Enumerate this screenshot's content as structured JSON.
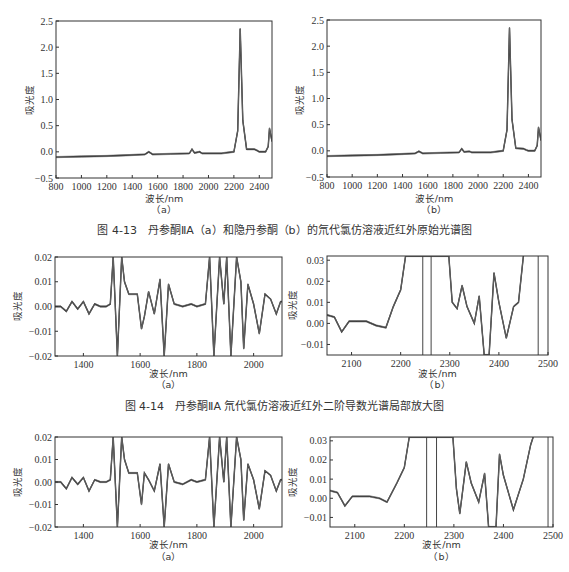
{
  "figures": [
    {
      "id": "fig-4-13",
      "caption": "图 4-13　丹参酮ⅡA（a）和隐丹参酮（b）的氘代氯仿溶液近红外原始光谱图"
    },
    {
      "id": "fig-4-14",
      "caption": "图 4-14　丹参酮ⅡA 氘代氯仿溶液近红外二阶导数光谱局部放大图"
    },
    {
      "id": "fig-4-15",
      "caption": ""
    }
  ],
  "common": {
    "xlabel": "波长/nm",
    "ylabel": "吸光度",
    "sub_a": "（a）",
    "sub_b": "（b）"
  },
  "chart_data": [
    {
      "panel": "4-13a",
      "type": "line",
      "title": "",
      "xlabel": "波长/nm",
      "ylabel": "吸光度",
      "xlim": [
        800,
        2500
      ],
      "ylim": [
        -0.5,
        2.5
      ],
      "xticks": [
        800,
        1000,
        1200,
        1400,
        1600,
        1800,
        2000,
        2200,
        2400
      ],
      "yticks": [
        -0.5,
        0.0,
        0.5,
        1.0,
        1.5,
        2.0,
        2.5
      ],
      "x": [
        800,
        1000,
        1200,
        1400,
        1500,
        1530,
        1560,
        1700,
        1850,
        1870,
        1890,
        1930,
        1950,
        2100,
        2200,
        2230,
        2250,
        2270,
        2300,
        2360,
        2380,
        2400,
        2450,
        2470,
        2480,
        2500
      ],
      "y": [
        -0.1,
        -0.09,
        -0.08,
        -0.06,
        -0.05,
        0.0,
        -0.05,
        -0.04,
        -0.03,
        0.05,
        -0.02,
        -0.0,
        -0.03,
        -0.03,
        0.0,
        0.4,
        2.35,
        0.6,
        0.05,
        0.05,
        0.03,
        0.0,
        0.0,
        0.1,
        0.45,
        0.2
      ]
    },
    {
      "panel": "4-13b",
      "type": "line",
      "title": "",
      "xlabel": "波长/nm",
      "ylabel": "吸光度",
      "xlim": [
        800,
        2500
      ],
      "ylim": [
        -0.5,
        2.5
      ],
      "xticks": [
        800,
        1000,
        1200,
        1400,
        1600,
        1800,
        2000,
        2200,
        2400
      ],
      "yticks": [
        -0.5,
        0.0,
        0.5,
        1.0,
        1.5,
        2.0,
        2.5
      ],
      "x": [
        800,
        1000,
        1200,
        1400,
        1500,
        1530,
        1560,
        1700,
        1850,
        1870,
        1890,
        1930,
        1950,
        2100,
        2200,
        2230,
        2250,
        2270,
        2300,
        2360,
        2380,
        2400,
        2450,
        2470,
        2480,
        2500
      ],
      "y": [
        -0.1,
        -0.09,
        -0.08,
        -0.06,
        -0.05,
        -0.01,
        -0.05,
        -0.04,
        -0.03,
        0.04,
        -0.02,
        -0.01,
        -0.03,
        -0.03,
        0.0,
        0.4,
        2.35,
        0.6,
        0.05,
        0.04,
        0.02,
        0.0,
        0.0,
        0.1,
        0.45,
        0.2
      ]
    },
    {
      "panel": "4-14a",
      "type": "line",
      "title": "",
      "xlabel": "波长/nm",
      "ylabel": "吸光度",
      "xlim": [
        1300,
        2100
      ],
      "ylim": [
        -0.02,
        0.02
      ],
      "xticks": [
        1400,
        1600,
        1800,
        2000
      ],
      "yticks": [
        -0.02,
        -0.01,
        0.0,
        0.01,
        0.02
      ],
      "x": [
        1300,
        1320,
        1340,
        1360,
        1380,
        1400,
        1420,
        1440,
        1460,
        1480,
        1495,
        1505,
        1520,
        1535,
        1545,
        1560,
        1590,
        1605,
        1615,
        1630,
        1650,
        1670,
        1685,
        1700,
        1720,
        1750,
        1780,
        1800,
        1830,
        1845,
        1860,
        1880,
        1895,
        1905,
        1920,
        1940,
        1955,
        1965,
        1980,
        2000,
        2020,
        2040,
        2060,
        2080,
        2095,
        2100
      ],
      "y": [
        0.0,
        0.0,
        -0.002,
        0.002,
        -0.001,
        0.002,
        -0.003,
        0.001,
        0.0,
        0.0,
        0.001,
        0.02,
        -0.02,
        0.02,
        0.01,
        0.005,
        0.005,
        -0.009,
        -0.004,
        0.006,
        -0.003,
        0.011,
        -0.02,
        0.009,
        0.001,
        0.0,
        0.001,
        0.0,
        0.001,
        0.02,
        -0.02,
        0.02,
        0.001,
        0.02,
        -0.02,
        0.02,
        0.01,
        -0.017,
        0.009,
        0.001,
        -0.011,
        0.005,
        0.003,
        -0.003,
        0.002,
        0.002
      ]
    },
    {
      "panel": "4-14b",
      "type": "line",
      "title": "",
      "xlabel": "波长/nm",
      "ylabel": "吸光度",
      "xlim": [
        2050,
        2500
      ],
      "ylim": [
        -0.015,
        0.032
      ],
      "xticks": [
        2100,
        2200,
        2300,
        2400,
        2500
      ],
      "yticks": [
        -0.01,
        0.0,
        0.01,
        0.02,
        0.03
      ],
      "x": [
        2050,
        2065,
        2080,
        2095,
        2110,
        2130,
        2150,
        2170,
        2185,
        2200,
        2210,
        2245,
        2262,
        2298,
        2305,
        2315,
        2325,
        2335,
        2350,
        2360,
        2370,
        2380,
        2390,
        2400,
        2415,
        2430,
        2440,
        2450
      ],
      "y": [
        0.004,
        0.003,
        -0.004,
        0.001,
        0.001,
        0.001,
        -0.001,
        -0.002,
        0.008,
        0.016,
        0.032,
        0.032,
        0.032,
        0.032,
        0.01,
        0.007,
        0.018,
        0.008,
        0.0,
        0.013,
        -0.015,
        -0.015,
        0.024,
        0.01,
        -0.007,
        0.008,
        0.01,
        0.032
      ],
      "vlines": [
        2245,
        2262,
        2480
      ]
    },
    {
      "panel": "4-15a",
      "type": "line",
      "title": "",
      "xlabel": "波长/nm",
      "ylabel": "吸光度",
      "xlim": [
        1300,
        2100
      ],
      "ylim": [
        -0.02,
        0.02
      ],
      "xticks": [
        1400,
        1600,
        1800,
        2000
      ],
      "yticks": [
        -0.02,
        -0.01,
        0.0,
        0.01,
        0.02
      ],
      "x": [
        1300,
        1320,
        1340,
        1360,
        1380,
        1400,
        1420,
        1440,
        1460,
        1480,
        1495,
        1505,
        1520,
        1535,
        1545,
        1560,
        1590,
        1605,
        1615,
        1630,
        1650,
        1670,
        1685,
        1700,
        1720,
        1750,
        1780,
        1800,
        1830,
        1845,
        1860,
        1880,
        1895,
        1905,
        1920,
        1940,
        1955,
        1965,
        1980,
        2000,
        2020,
        2040,
        2060,
        2080,
        2095,
        2100
      ],
      "y": [
        0.0,
        0.0,
        -0.003,
        0.002,
        -0.001,
        0.002,
        -0.004,
        0.001,
        0.0,
        0.0,
        0.001,
        0.02,
        -0.02,
        0.02,
        0.01,
        0.004,
        0.004,
        -0.01,
        0.004,
        0.001,
        -0.004,
        0.008,
        -0.02,
        0.008,
        0.0,
        -0.001,
        0.001,
        0.0,
        0.001,
        0.02,
        -0.02,
        0.02,
        0.0,
        0.02,
        -0.02,
        0.02,
        0.01,
        -0.017,
        0.008,
        0.001,
        -0.012,
        0.005,
        0.003,
        -0.004,
        0.001,
        0.001
      ]
    },
    {
      "panel": "4-15b",
      "type": "line",
      "title": "",
      "xlabel": "波长/nm",
      "ylabel": "吸光度",
      "xlim": [
        2050,
        2500
      ],
      "ylim": [
        -0.015,
        0.032
      ],
      "xticks": [
        2100,
        2200,
        2300,
        2400,
        2500
      ],
      "yticks": [
        -0.01,
        0.0,
        0.01,
        0.02,
        0.03
      ],
      "x": [
        2050,
        2065,
        2080,
        2095,
        2110,
        2130,
        2150,
        2165,
        2185,
        2200,
        2210,
        2245,
        2262,
        2298,
        2305,
        2312,
        2325,
        2335,
        2350,
        2362,
        2370,
        2385,
        2392,
        2400,
        2420,
        2440,
        2455,
        2460
      ],
      "y": [
        0.004,
        0.003,
        -0.004,
        0.001,
        0.001,
        0.001,
        0.0,
        -0.002,
        0.008,
        0.016,
        0.032,
        0.032,
        0.032,
        0.032,
        0.005,
        -0.008,
        0.019,
        0.008,
        -0.002,
        0.013,
        -0.015,
        -0.015,
        0.023,
        0.012,
        -0.006,
        0.01,
        0.028,
        0.032
      ],
      "vlines": [
        2245,
        2265,
        2490
      ]
    }
  ]
}
